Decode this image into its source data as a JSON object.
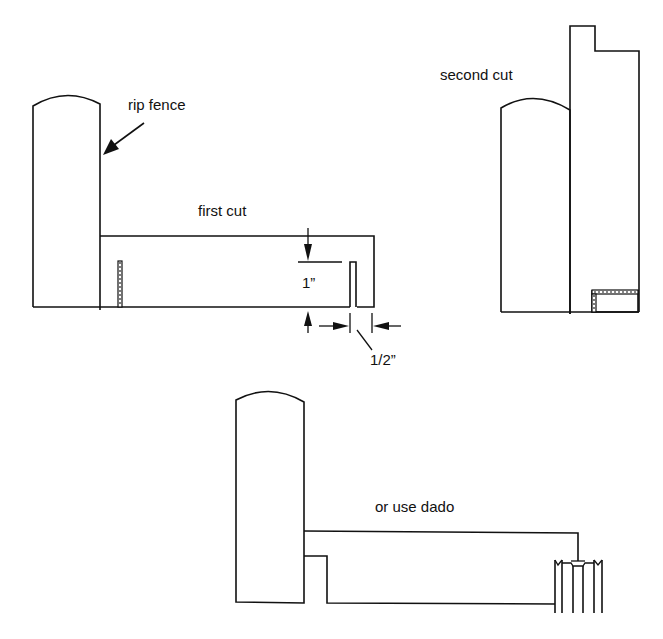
{
  "diagram": {
    "panels": [
      {
        "id": "first-cut",
        "label": "first cut",
        "annotations": [
          {
            "text": "rip fence",
            "points_to": "fence-face"
          },
          {
            "text": "1”",
            "meaning": "cut depth"
          },
          {
            "text": "1/2”",
            "meaning": "distance from end"
          }
        ]
      },
      {
        "id": "second-cut",
        "label": "second cut"
      },
      {
        "id": "dado-option",
        "label": "or use dado"
      }
    ],
    "labels": {
      "rip_fence": "rip fence",
      "first_cut": "first cut",
      "dim_depth": "1”",
      "dim_offset": "1/2”",
      "second_cut": "second cut",
      "dado": "or use dado"
    },
    "colors": {
      "line": "#111111",
      "background": "#ffffff"
    }
  }
}
